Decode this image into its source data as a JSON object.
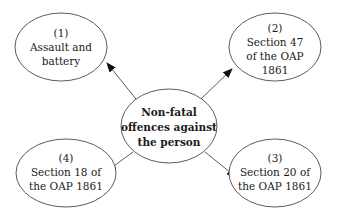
{
  "diagram": {
    "type": "hub-and-spoke",
    "center": {
      "lines": [
        "Non-fatal",
        "offences against",
        "the person"
      ]
    },
    "nodes": [
      {
        "id": "1",
        "lines": [
          "(1)",
          "Assault and",
          "battery"
        ]
      },
      {
        "id": "2",
        "lines": [
          "(2)",
          "Section 47",
          "of the OAP",
          "1861"
        ]
      },
      {
        "id": "3",
        "lines": [
          "(3)",
          "Section 20 of",
          "the OAP 1861"
        ]
      },
      {
        "id": "4",
        "lines": [
          "(4)",
          "Section 18 of",
          "the OAP 1861"
        ]
      }
    ],
    "edges": [
      {
        "from": "center",
        "to": "1"
      },
      {
        "from": "center",
        "to": "2"
      },
      {
        "from": "center",
        "to": "3"
      },
      {
        "from": "center",
        "to": "4"
      }
    ],
    "colors": {
      "stroke": "#333333",
      "background": "#ffffff",
      "text": "#1a1a1a"
    }
  }
}
